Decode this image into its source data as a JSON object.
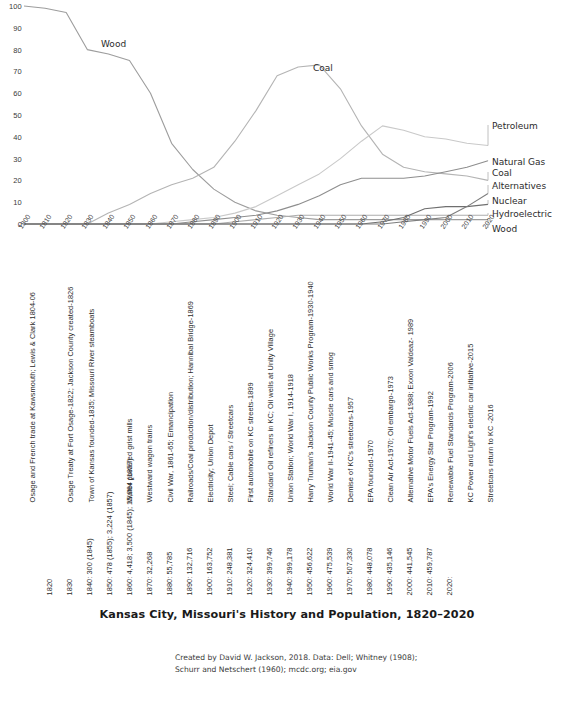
{
  "chart_data": {
    "type": "line",
    "title": "Kansas City, Missouri's History and Population, 1820–2020",
    "xlabel": "",
    "ylabel": "",
    "ylim": [
      0,
      100
    ],
    "xlim": [
      1800,
      2020
    ],
    "grid": false,
    "legend_position": "right-inline",
    "y_ticks": [
      "100",
      "90",
      "80",
      "70",
      "60",
      "50",
      "40",
      "30",
      "20",
      "10",
      "0"
    ],
    "x_ticks": [
      "1800",
      "1810",
      "1820",
      "1830",
      "1840",
      "1850",
      "1860",
      "1870",
      "1880",
      "1890",
      "1900",
      "1910",
      "1920",
      "1930",
      "1940",
      "1950",
      "1960",
      "1970",
      "1980",
      "1990",
      "2000",
      "2010",
      "2020"
    ],
    "x": [
      1800,
      1810,
      1820,
      1830,
      1840,
      1850,
      1860,
      1870,
      1880,
      1890,
      1900,
      1910,
      1920,
      1930,
      1940,
      1950,
      1960,
      1970,
      1980,
      1990,
      2000,
      2010,
      2020
    ],
    "series": [
      {
        "name": "Wood",
        "color": "#9d9d9d",
        "values": [
          100,
          99,
          97,
          80,
          78,
          75,
          60,
          37,
          25,
          16,
          10,
          6,
          4,
          3,
          2,
          2,
          2,
          2,
          2,
          2,
          2,
          2,
          2
        ]
      },
      {
        "name": "Coal",
        "color": "#b4b4b4",
        "values": [
          0,
          0,
          0,
          0,
          5,
          9,
          14,
          18,
          21,
          26,
          38,
          52,
          68,
          72,
          73,
          62,
          45,
          32,
          26,
          24,
          23,
          22,
          20
        ]
      },
      {
        "name": "Petroleum",
        "color": "#c9c9c9",
        "values": [
          0,
          0,
          0,
          0,
          0,
          0,
          0,
          1,
          2,
          3,
          5,
          8,
          13,
          18,
          23,
          30,
          38,
          45,
          43,
          40,
          39,
          37,
          36
        ]
      },
      {
        "name": "Natural Gas",
        "color": "#8e8e8e",
        "values": [
          0,
          0,
          0,
          0,
          0,
          0,
          0,
          0,
          1,
          2,
          3,
          4,
          6,
          9,
          13,
          18,
          21,
          21,
          21,
          22,
          24,
          26,
          29
        ]
      },
      {
        "name": "Hydroelectric",
        "color": "#adadad",
        "values": [
          0,
          0,
          0,
          0,
          0,
          0,
          0,
          0,
          0,
          0,
          1,
          2,
          3,
          4,
          4,
          4,
          4,
          4,
          4,
          4,
          4,
          4,
          4
        ]
      },
      {
        "name": "Nuclear",
        "color": "#6f6f6f",
        "values": [
          0,
          0,
          0,
          0,
          0,
          0,
          0,
          0,
          0,
          0,
          0,
          0,
          0,
          0,
          0,
          0,
          0,
          1,
          3,
          7,
          8,
          8,
          9
        ]
      },
      {
        "name": "Alternatives",
        "color": "#7d7d7d",
        "values": [
          0,
          0,
          0,
          0,
          0,
          0,
          0,
          0,
          0,
          0,
          0,
          0,
          0,
          0,
          0,
          0,
          0,
          0,
          1,
          2,
          3,
          8,
          14
        ]
      }
    ],
    "inline_labels": [
      {
        "text": "Wood",
        "x": 101,
        "y": 46
      },
      {
        "text": "Coal",
        "x": 313,
        "y": 70
      },
      {
        "text": "Petroleum",
        "x": 492,
        "y": 128
      },
      {
        "text": "Natural Gas",
        "x": 492,
        "y": 164
      },
      {
        "text": "Coal",
        "x": 492,
        "y": 175
      },
      {
        "text": "Alternatives",
        "x": 492,
        "y": 188
      },
      {
        "text": "Nuclear",
        "x": 492,
        "y": 203
      },
      {
        "text": "Hydroelectric",
        "x": 492,
        "y": 216
      },
      {
        "text": "Wood",
        "x": 492,
        "y": 231
      }
    ]
  },
  "events": [
    {
      "text": "Osage and French trade at Kawsmouth; Lewis & Clark 1804-06",
      "x": 36
    },
    {
      "text": "Osage Treaty at Fort Osage-1822; Jackson County created-1826",
      "x": 74
    },
    {
      "text": "Town of Kansas founded-1835; Missouri River steamboats",
      "x": 95
    },
    {
      "text": "Water powered grist mills",
      "x": 133
    },
    {
      "text": "Westward wagon trains",
      "x": 153
    },
    {
      "text": "Civil War, 1861-65; Emancipation",
      "x": 174
    },
    {
      "text": "Railroads/Coal production/distribution; Hannibal Bridge-1869",
      "x": 194
    },
    {
      "text": "Electricity; Union Depot",
      "x": 214
    },
    {
      "text": "Steel; Cable cars / Streetcars",
      "x": 234
    },
    {
      "text": "First automobile on KC streets-1899",
      "x": 254
    },
    {
      "text": "Standard Oil refiners in KC; Oil wells at Unity Village",
      "x": 274
    },
    {
      "text": "Union Station; World War I, 1914-1918",
      "x": 294
    },
    {
      "text": "Harry Truman's Jackson County Public Works Program-1930-1940",
      "x": 314
    },
    {
      "text": "World War II-1941-45; Muscle cars and smog",
      "x": 334
    },
    {
      "text": "Demise of KC's streetcars-1957",
      "x": 354
    },
    {
      "text": "EPA founded-1970",
      "x": 374
    },
    {
      "text": "Clean Air Act-1970; Oil embargo-1973",
      "x": 394
    },
    {
      "text": "Alternative Motor Fuels Act-1988; Exxon Valdeaz- 1989",
      "x": 414
    },
    {
      "text": "EPA's Energy Star Program-1992",
      "x": 434
    },
    {
      "text": "Renewable Fuel Standards Program-2006",
      "x": 454
    },
    {
      "text": "KC Power and Light's electric car initiative-2015",
      "x": 474
    },
    {
      "text": "Streetcars return to KC -2016",
      "x": 494
    }
  ],
  "populations": [
    {
      "text": "1820",
      "x": 53
    },
    {
      "text": "1830",
      "x": 73
    },
    {
      "text": "1840:  300 (1845)",
      "x": 93
    },
    {
      "text": "1850:  478 (1855);  3,224 (1857)",
      "x": 113
    },
    {
      "text": "1860:  4,418;  3,500 (1845);  15,064 (1857)",
      "x": 133
    },
    {
      "text": "1870:  32,268",
      "x": 153
    },
    {
      "text": "1880:  55,785",
      "x": 173
    },
    {
      "text": "1890:  132,716",
      "x": 193
    },
    {
      "text": "1900:  163,752",
      "x": 213
    },
    {
      "text": "1910:  248,381",
      "x": 233
    },
    {
      "text": "1920:  324,410",
      "x": 253
    },
    {
      "text": "1930:  399,746",
      "x": 273
    },
    {
      "text": "1940:  399,178",
      "x": 293
    },
    {
      "text": "1950:  456,622",
      "x": 313
    },
    {
      "text": "1960:  475,539",
      "x": 333
    },
    {
      "text": "1970:  507,330",
      "x": 353
    },
    {
      "text": "1980:  448,078",
      "x": 373
    },
    {
      "text": "1990:  435,146",
      "x": 393
    },
    {
      "text": "2000:  441,545",
      "x": 413
    },
    {
      "text": "2010:  459,787",
      "x": 433
    },
    {
      "text": "2020:",
      "x": 453
    }
  ],
  "credit": {
    "line1": "Created by David W. Jackson, 2018. Data: Dell; Whitney (1908);",
    "line2": "Schurr and Netschert (1960); mcdc.org; eia.gov"
  }
}
